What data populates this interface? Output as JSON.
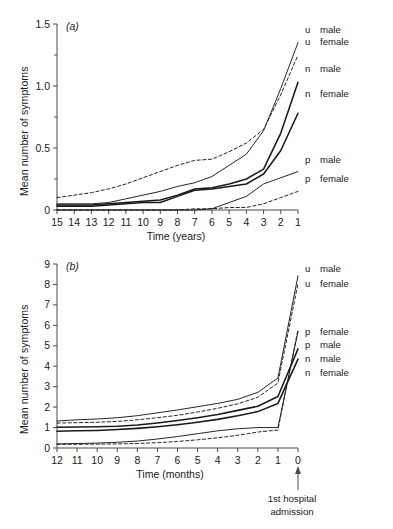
{
  "figure": {
    "background": "#ffffff",
    "line_color": "#1a1a1a",
    "axis_color": "#4a4a4a"
  },
  "panel_a": {
    "tag": "(a)",
    "ylabel": "Mean number of symptoms",
    "xlabel": "Time (years)",
    "legend": [
      {
        "key": "u",
        "label": "male"
      },
      {
        "key": "u",
        "label": "female"
      },
      {
        "key": "n",
        "label": "male"
      },
      {
        "key": "n",
        "label": "female"
      },
      {
        "key": "p",
        "label": "male"
      },
      {
        "key": "p",
        "label": "female"
      }
    ]
  },
  "panel_b": {
    "tag": "(b)",
    "ylabel": "Mean number of symptoms",
    "xlabel": "Time (months)",
    "annotation_line1": "1st hospital",
    "annotation_line2": "admission",
    "legend": [
      {
        "key": "u",
        "label": "male"
      },
      {
        "key": "u",
        "label": "female"
      },
      {
        "key": "p",
        "label": "female"
      },
      {
        "key": "p",
        "label": "male"
      },
      {
        "key": "n",
        "label": "male"
      },
      {
        "key": "n",
        "label": "female"
      }
    ]
  },
  "chart_data": [
    {
      "type": "line",
      "title": "(a)",
      "xlabel": "Time (years)",
      "ylabel": "Mean number of symptoms",
      "xlim": [
        15,
        1
      ],
      "ylim": [
        0,
        1.5
      ],
      "x_reversed": true,
      "grid": false,
      "legend_position": "right",
      "xticks": [
        15,
        14,
        13,
        12,
        11,
        10,
        9,
        8,
        7,
        6,
        5,
        4,
        3,
        2,
        1
      ],
      "yticks": [
        0,
        0.5,
        1.0,
        1.5
      ],
      "yticklabels": [
        "0",
        "0.5",
        "1.0",
        "1.5"
      ],
      "yminorticks": [
        0.25,
        0.75,
        1.25
      ],
      "x": [
        15,
        14,
        13,
        12,
        11,
        10,
        9,
        8,
        7,
        6,
        5,
        4,
        3,
        2,
        1
      ],
      "series": [
        {
          "name": "u male",
          "style": "solid",
          "values": [
            0.05,
            0.05,
            0.05,
            0.06,
            0.09,
            0.12,
            0.15,
            0.19,
            0.22,
            0.27,
            0.36,
            0.45,
            0.64,
            0.98,
            1.35
          ]
        },
        {
          "name": "u female",
          "style": "dashed",
          "values": [
            0.1,
            0.12,
            0.14,
            0.17,
            0.21,
            0.26,
            0.31,
            0.36,
            0.4,
            0.41,
            0.47,
            0.54,
            0.65,
            0.93,
            1.25
          ]
        },
        {
          "name": "n male",
          "style": "solid",
          "values": [
            0.04,
            0.04,
            0.04,
            0.05,
            0.06,
            0.07,
            0.08,
            0.12,
            0.17,
            0.18,
            0.21,
            0.25,
            0.33,
            0.62,
            1.03
          ]
        },
        {
          "name": "n female",
          "style": "solid",
          "values": [
            0.03,
            0.03,
            0.03,
            0.04,
            0.05,
            0.06,
            0.06,
            0.11,
            0.16,
            0.17,
            0.19,
            0.21,
            0.29,
            0.48,
            0.78
          ]
        },
        {
          "name": "p male",
          "style": "solid",
          "values": [
            0.0,
            0.0,
            0.0,
            0.0,
            0.0,
            0.0,
            0.0,
            0.0,
            0.0,
            0.01,
            0.06,
            0.11,
            0.21,
            0.26,
            0.31
          ]
        },
        {
          "name": "p female",
          "style": "dashed",
          "values": [
            0.0,
            0.0,
            0.0,
            0.0,
            0.0,
            0.0,
            0.0,
            0.0,
            0.01,
            0.01,
            0.02,
            0.02,
            0.05,
            0.1,
            0.15
          ]
        }
      ]
    },
    {
      "type": "line",
      "title": "(b)",
      "xlabel": "Time (months)",
      "ylabel": "Mean number of symptoms",
      "xlim": [
        12,
        0
      ],
      "ylim": [
        0,
        9
      ],
      "x_reversed": true,
      "grid": false,
      "legend_position": "right",
      "xticks": [
        12,
        11,
        10,
        9,
        8,
        7,
        6,
        5,
        4,
        3,
        2,
        1,
        0
      ],
      "yticks": [
        0,
        1,
        2,
        3,
        4,
        5,
        6,
        7,
        8,
        9
      ],
      "annotation": "1st hospital admission",
      "annotation_x": 0,
      "x": [
        12,
        11,
        10,
        9,
        8,
        7,
        6,
        5,
        4,
        3,
        2,
        1,
        0
      ],
      "series": [
        {
          "name": "u male",
          "style": "solid",
          "values": [
            1.32,
            1.38,
            1.42,
            1.48,
            1.58,
            1.72,
            1.86,
            2.02,
            2.18,
            2.38,
            2.72,
            3.42,
            8.42
          ]
        },
        {
          "name": "u female",
          "style": "dashed",
          "values": [
            1.22,
            1.24,
            1.26,
            1.3,
            1.38,
            1.48,
            1.6,
            1.76,
            1.94,
            2.16,
            2.48,
            3.18,
            8.05
          ]
        },
        {
          "name": "p female",
          "style": "dashed",
          "values": [
            0.18,
            0.18,
            0.19,
            0.2,
            0.22,
            0.26,
            0.32,
            0.4,
            0.5,
            0.62,
            0.78,
            0.88,
            5.8
          ]
        },
        {
          "name": "p male",
          "style": "solid",
          "values": [
            0.2,
            0.22,
            0.24,
            0.28,
            0.34,
            0.44,
            0.56,
            0.7,
            0.84,
            0.94,
            1.0,
            1.0,
            5.7
          ]
        },
        {
          "name": "n male",
          "style": "solid",
          "values": [
            1.02,
            1.03,
            1.04,
            1.06,
            1.12,
            1.22,
            1.34,
            1.48,
            1.64,
            1.84,
            2.04,
            2.52,
            4.85
          ]
        },
        {
          "name": "n female",
          "style": "solid",
          "values": [
            0.82,
            0.84,
            0.86,
            0.9,
            0.96,
            1.04,
            1.14,
            1.26,
            1.4,
            1.58,
            1.78,
            2.18,
            4.35
          ]
        }
      ]
    }
  ]
}
